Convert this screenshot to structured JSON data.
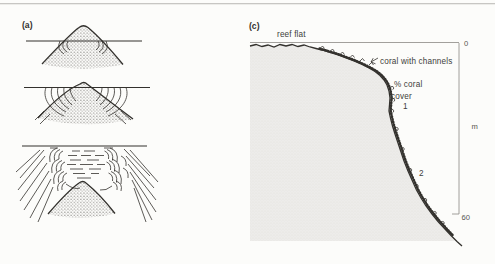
{
  "figure": {
    "panel_a": {
      "label": "(a)"
    },
    "panel_c": {
      "label": "(c)",
      "reef_flat": "reef flat",
      "coral_with_channels": "coral with channels",
      "coral_cover_line1": "% coral",
      "coral_cover_line2": "cover",
      "marker_1": "1",
      "marker_2": "2",
      "axis": {
        "top": "0",
        "unit": "m",
        "bottom": "60"
      }
    },
    "colors": {
      "background": "#fcfcfa",
      "ink": "#33312d",
      "reef_fill": "#edecea",
      "top_rule": "#c7c6c3"
    }
  }
}
